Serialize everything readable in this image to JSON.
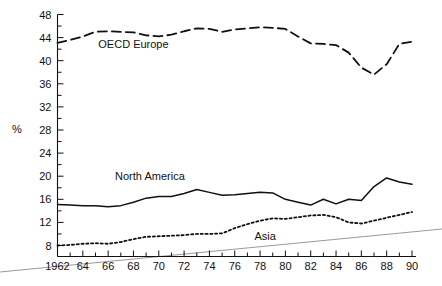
{
  "chart_data": {
    "type": "line",
    "title": "",
    "xlabel": "",
    "ylabel": "%",
    "xlim": [
      1962,
      1990
    ],
    "ylim": [
      6,
      48
    ],
    "grid": false,
    "legend": "inline-annotations",
    "y_ticks_major": [
      8,
      12,
      16,
      20,
      24,
      28,
      32,
      36,
      40,
      44,
      48
    ],
    "y_ticks_minor": [
      10,
      14,
      18,
      22,
      26,
      30,
      34,
      38,
      42,
      46
    ],
    "x_ticks_major": [
      1962,
      1964,
      1966,
      1968,
      1970,
      1972,
      1974,
      1976,
      1978,
      1980,
      1982,
      1984,
      1986,
      1988,
      1990
    ],
    "x_tick_labels": [
      "1962",
      "64",
      "66",
      "68",
      "70",
      "72",
      "74",
      "76",
      "78",
      "80",
      "82",
      "84",
      "86",
      "88",
      "90"
    ],
    "x_ticks_minor": [
      1963,
      1965,
      1967,
      1969,
      1971,
      1973,
      1975,
      1977,
      1979,
      1981,
      1983,
      1985,
      1987,
      1989
    ],
    "x": [
      1962,
      1963,
      1964,
      1965,
      1966,
      1967,
      1968,
      1969,
      1970,
      1971,
      1972,
      1973,
      1974,
      1975,
      1976,
      1977,
      1978,
      1979,
      1980,
      1981,
      1982,
      1983,
      1984,
      1985,
      1986,
      1987,
      1988,
      1989,
      1990
    ],
    "series": [
      {
        "name": "OECD Europe",
        "style": "dashed",
        "label_x": 1968.0,
        "label_y": 42.2,
        "values": [
          43.1,
          43.6,
          44.2,
          45.0,
          45.1,
          45.0,
          44.9,
          44.4,
          44.2,
          44.5,
          45.1,
          45.6,
          45.5,
          45.0,
          45.4,
          45.6,
          45.8,
          45.7,
          45.5,
          44.2,
          43.0,
          42.9,
          42.7,
          41.4,
          38.8,
          37.6,
          39.4,
          42.9,
          43.3
        ]
      },
      {
        "name": "North America",
        "style": "solid",
        "label_x": 1969.3,
        "label_y": 19.3,
        "values": [
          15.1,
          15.0,
          14.9,
          14.9,
          14.7,
          14.9,
          15.5,
          16.2,
          16.5,
          16.5,
          17.0,
          17.7,
          17.2,
          16.7,
          16.8,
          17.0,
          17.2,
          17.1,
          16.0,
          15.5,
          15.0,
          16.0,
          15.2,
          16.0,
          15.8,
          18.2,
          19.7,
          19.0,
          18.6
        ]
      },
      {
        "name": "Asia",
        "style": "dotted",
        "label_x": 1978.4,
        "label_y": 9.0,
        "values": [
          8.0,
          8.1,
          8.3,
          8.4,
          8.3,
          8.6,
          9.1,
          9.5,
          9.6,
          9.7,
          9.8,
          10.0,
          10.0,
          10.1,
          11.0,
          11.7,
          12.3,
          12.7,
          12.6,
          12.9,
          13.2,
          13.3,
          12.9,
          12.0,
          11.8,
          12.3,
          12.8,
          13.3,
          13.8
        ]
      }
    ]
  }
}
